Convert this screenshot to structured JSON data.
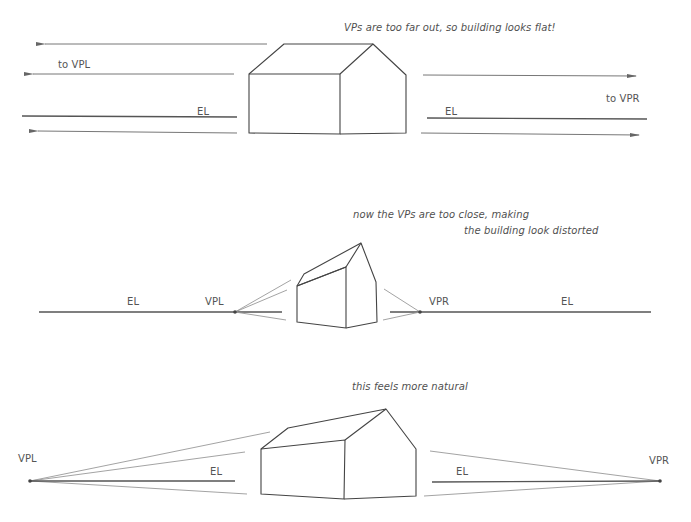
{
  "colors": {
    "background": "#ffffff",
    "line_dark": "#4a4a4a",
    "line_mid": "#777777",
    "line_light": "#a8a8a8",
    "text": "#555555"
  },
  "panels": [
    {
      "id": "too-far",
      "caption": "VPs are too far out, so building looks flat!",
      "labels": {
        "to_vpl": "to VPL",
        "to_vpr": "to VPR",
        "el_left": "EL",
        "el_right": "EL"
      }
    },
    {
      "id": "too-close",
      "caption_line1": "now the VPs are too close, making",
      "caption_line2": "the building look distorted",
      "labels": {
        "el_left": "EL",
        "vpl": "VPL",
        "vpr": "VPR",
        "el_right": "EL"
      }
    },
    {
      "id": "natural",
      "caption": "this feels more natural",
      "labels": {
        "vpl": "VPL",
        "el_left": "EL",
        "el_right": "EL",
        "vpr": "VPR"
      }
    }
  ]
}
